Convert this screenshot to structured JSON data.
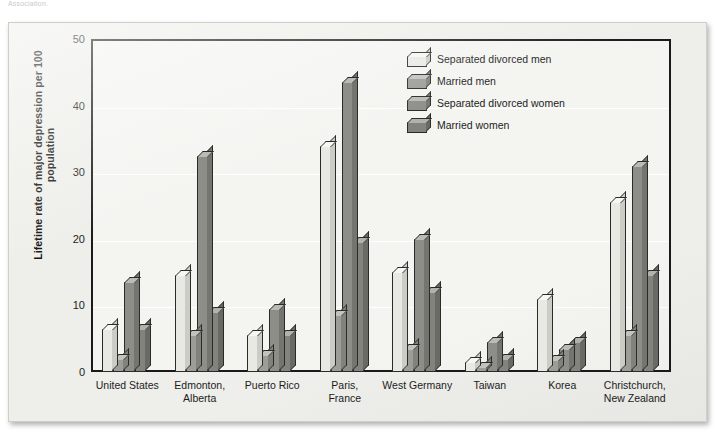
{
  "caption_fragment": "Association.",
  "chart_data": {
    "type": "bar",
    "title": "",
    "xlabel": "",
    "ylabel": "Lifetime rate of major depression per 100 population",
    "ylim": [
      0,
      50
    ],
    "yticks": [
      0,
      10,
      20,
      30,
      40,
      50
    ],
    "grid": true,
    "legend_position": "top-right",
    "categories": [
      "United States",
      "Edmonton, Alberta",
      "Puerto Rico",
      "Paris, France",
      "West Germany",
      "Taiwan",
      "Korea",
      "Christchurch, New Zealand"
    ],
    "category_lines": [
      [
        "United States"
      ],
      [
        "Edmonton,",
        "Alberta"
      ],
      [
        "Puerto Rico"
      ],
      [
        "Paris,",
        "France"
      ],
      [
        "West Germany"
      ],
      [
        "Taiwan"
      ],
      [
        "Korea"
      ],
      [
        "Christchurch,",
        "New Zealand"
      ]
    ],
    "series": [
      {
        "name": "Separated divorced men",
        "color": "#e9e9e4",
        "top_color": "#f6f6f2",
        "side_color": "#ccccc6",
        "values": [
          6.5,
          14.5,
          5.5,
          34,
          15,
          1.5,
          11,
          25.5
        ]
      },
      {
        "name": "Married men",
        "color": "#9d9d97",
        "top_color": "#c3c3bd",
        "side_color": "#82827c",
        "values": [
          2,
          5.5,
          2.5,
          8.5,
          3.5,
          0.8,
          1.8,
          5.5
        ]
      },
      {
        "name": "Separated divorced women",
        "color": "#8e8e88",
        "top_color": "#bbbbb5",
        "side_color": "#75756f",
        "values": [
          13.5,
          32.5,
          9.5,
          43.5,
          20,
          4.5,
          3.5,
          31
        ]
      },
      {
        "name": "Married women",
        "color": "#83837d",
        "top_color": "#b2b2ac",
        "side_color": "#6a6a64",
        "values": [
          6.5,
          9,
          5.5,
          19.5,
          12,
          2,
          4.5,
          14.5
        ]
      }
    ]
  }
}
